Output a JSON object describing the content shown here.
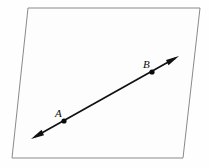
{
  "figure": {
    "type": "geometry-diagram",
    "background_color": "#fefefe",
    "plane": {
      "name": "plane",
      "shape": "parallelogram",
      "stroke_color": "#8a8a8a",
      "fill_color": "#fdfdfd",
      "stroke_width": 1,
      "corners": [
        {
          "x": 28,
          "y": 8
        },
        {
          "x": 200,
          "y": 8
        },
        {
          "x": 183,
          "y": 158
        },
        {
          "x": 12,
          "y": 158
        }
      ]
    },
    "line": {
      "name": "line-AB",
      "color": "#111111",
      "stroke_width": 1.7,
      "double_headed": true,
      "start": {
        "x": 31,
        "y": 139
      },
      "end": {
        "x": 179,
        "y": 56
      },
      "arrowheads": [
        {
          "name": "arrowhead-lower-left",
          "tip_x": 31,
          "tip_y": 139
        },
        {
          "name": "arrowhead-upper-right",
          "tip_x": 179,
          "tip_y": 56
        }
      ]
    },
    "points": [
      {
        "id": "A",
        "label": "A",
        "dot": {
          "x": 64,
          "y": 121,
          "r": 2.6
        },
        "label_pos": {
          "x": 55,
          "y": 117
        },
        "color": "#0a0a0a"
      },
      {
        "id": "B",
        "label": "B",
        "dot": {
          "x": 152,
          "y": 72,
          "r": 2.6
        },
        "label_pos": {
          "x": 143,
          "y": 68
        },
        "color": "#0a0a0a"
      }
    ]
  }
}
